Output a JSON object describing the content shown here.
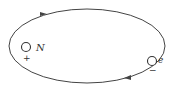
{
  "diagram": {
    "nucleus": {
      "label": "N",
      "charge": "+"
    },
    "electron": {
      "label": "e",
      "charge": "−"
    },
    "orbit": {
      "direction": "clockwise"
    },
    "colors": {
      "stroke": "#444444",
      "background": "#ffffff"
    }
  }
}
